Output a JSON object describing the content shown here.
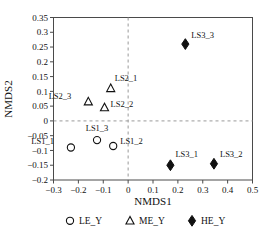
{
  "chart_data": {
    "type": "scatter",
    "title": "",
    "xlabel": "NMDS1",
    "ylabel": "NMDS2",
    "xlim": [
      -0.3,
      0.5
    ],
    "ylim": [
      -0.2,
      0.35
    ],
    "xticks": [
      "-0.3",
      "-0.2",
      "-0.1",
      "0",
      "0.1",
      "0.2",
      "0.3",
      "0.4",
      "0.5"
    ],
    "xtick_values": [
      -0.3,
      -0.2,
      -0.1,
      0,
      0.1,
      0.2,
      0.3,
      0.4,
      0.5
    ],
    "yticks": [
      "0.35",
      "0.3",
      "0.25",
      "0.2",
      "0.15",
      "0.1",
      "0.05",
      "0",
      "-0.05",
      "-0.1",
      "-0.15",
      "-0.2"
    ],
    "ytick_values": [
      0.35,
      0.3,
      0.25,
      0.2,
      0.15,
      0.1,
      0.05,
      0,
      -0.05,
      -0.1,
      -0.15,
      -0.2
    ],
    "grid": false,
    "reference_lines": [
      {
        "axis": "y",
        "value": 0,
        "style": "dashed"
      },
      {
        "axis": "x",
        "value": 0,
        "style": "dashed"
      }
    ],
    "legend_position": "bottom",
    "series": [
      {
        "name": "LE_Y",
        "marker": "circle-open",
        "points": [
          {
            "label": "LS1_1",
            "x": -0.23,
            "y": -0.09,
            "label_dx": -17,
            "label_dy": -4
          },
          {
            "label": "LS1_3",
            "x": -0.125,
            "y": -0.065,
            "label_dx": 0,
            "label_dy": -9
          },
          {
            "label": "LS1_2",
            "x": -0.06,
            "y": -0.085,
            "label_dx": 7,
            "label_dy": -2
          }
        ]
      },
      {
        "name": "ME_Y",
        "marker": "triangle-open",
        "points": [
          {
            "label": "LS2_1",
            "x": -0.07,
            "y": 0.11,
            "label_dx": 4,
            "label_dy": -7
          },
          {
            "label": "LS2_3",
            "x": -0.16,
            "y": 0.065,
            "label_dx": -17,
            "label_dy": -3
          },
          {
            "label": "LS2_2",
            "x": -0.095,
            "y": 0.045,
            "label_dx": 6,
            "label_dy": -1
          }
        ]
      },
      {
        "name": "HE_Y",
        "marker": "diamond-filled",
        "points": [
          {
            "label": "LS3_3",
            "x": 0.23,
            "y": 0.26,
            "label_dx": 6,
            "label_dy": -6
          },
          {
            "label": "LS3_1",
            "x": 0.17,
            "y": -0.15,
            "label_dx": 5,
            "label_dy": -8
          },
          {
            "label": "LS3_2",
            "x": 0.345,
            "y": -0.145,
            "label_dx": 6,
            "label_dy": -7
          }
        ]
      }
    ]
  },
  "legend": {
    "items": [
      {
        "label": "LE_Y",
        "marker": "circle-open"
      },
      {
        "label": "ME_Y",
        "marker": "triangle-open"
      },
      {
        "label": "HE_Y",
        "marker": "diamond-filled"
      }
    ]
  },
  "colors": {
    "marker": "#111111",
    "frame": "#4a4a4a",
    "reference_line": "#9a9a9a",
    "background": "#ffffff"
  }
}
